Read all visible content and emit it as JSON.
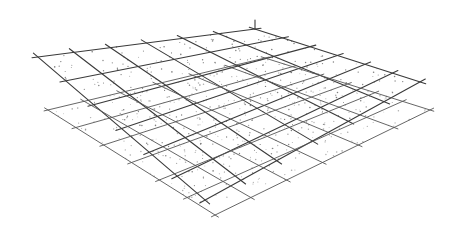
{
  "figure": {
    "type": "mesh-grid-diagram",
    "background": "#ffffff",
    "line_color": "#3a3a3a",
    "dot_color": "#6a6a6a",
    "layers": [
      {
        "name": "upper-plane",
        "corners": {
          "left": [
            38,
            57
          ],
          "top": [
            255,
            29
          ],
          "right": [
            420,
            82
          ],
          "bottom": [
            205,
            200
          ]
        },
        "divisions_u": 6,
        "divisions_v": 6,
        "extend": 6,
        "faint": false
      },
      {
        "name": "lower-plane",
        "corners": {
          "left": [
            48,
            110
          ],
          "top": [
            265,
            58
          ],
          "right": [
            430,
            110
          ],
          "bottom": [
            215,
            215
          ]
        },
        "divisions_u": 6,
        "divisions_v": 6,
        "extend": 4,
        "faint": true
      }
    ],
    "apex_tick": {
      "from": [
        255,
        29
      ],
      "to": [
        255,
        20
      ]
    },
    "dots_per_cell": 9
  }
}
